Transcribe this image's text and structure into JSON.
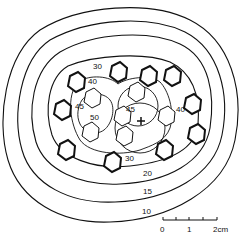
{
  "diagram": {
    "type": "contour-map",
    "contour_labels": [
      {
        "value": "10",
        "x": 142,
        "y": 214
      },
      {
        "value": "15",
        "x": 143,
        "y": 194
      },
      {
        "value": "20",
        "x": 143,
        "y": 176
      },
      {
        "value": "30",
        "x": 125,
        "y": 161
      },
      {
        "value": "30",
        "x": 93,
        "y": 69
      },
      {
        "value": "40",
        "x": 88,
        "y": 84
      },
      {
        "value": "40",
        "x": 176,
        "y": 112
      },
      {
        "value": "45",
        "x": 75,
        "y": 109
      },
      {
        "value": "45",
        "x": 126,
        "y": 112
      },
      {
        "value": "50",
        "x": 90,
        "y": 120
      }
    ],
    "center_marker": "+",
    "scale_bar": {
      "ticks": [
        "0",
        "1",
        "2cm"
      ],
      "unit": "cm"
    }
  }
}
